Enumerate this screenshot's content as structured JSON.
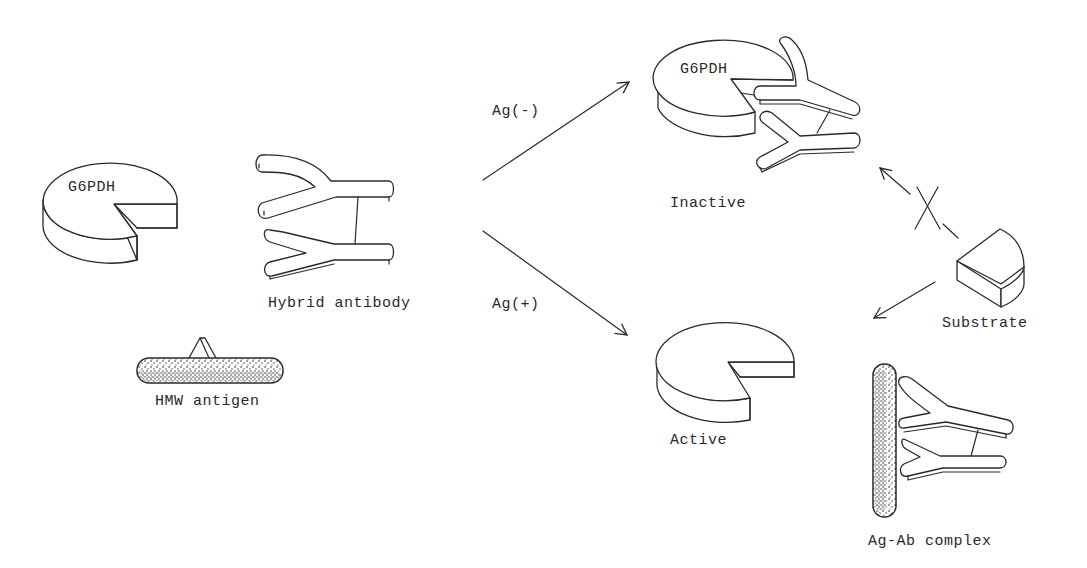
{
  "diagram": {
    "colors": {
      "ink": "#2a2a2a",
      "background": "#ffffff"
    },
    "components": {
      "enzyme_label": "G6PDH",
      "hybrid_antibody_label": "Hybrid antibody",
      "hmw_antigen_label": "HMW antigen",
      "inactive_label": "Inactive",
      "inactive_enzyme_label": "G6PDH",
      "active_label": "Active",
      "substrate_label": "Substrate",
      "complex_label": "Ag-Ab complex"
    },
    "edges": [
      {
        "from": "reagents",
        "to": "inactive",
        "label": "Ag(-)"
      },
      {
        "from": "reagents",
        "to": "active",
        "label": "Ag(+)"
      },
      {
        "from": "substrate",
        "to": "inactive",
        "label": "",
        "blocked": true
      },
      {
        "from": "substrate",
        "to": "active",
        "label": ""
      }
    ]
  }
}
